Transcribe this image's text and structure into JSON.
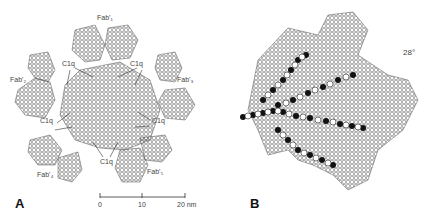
{
  "figure": {
    "panel_a": {
      "letter": "A",
      "labels": {
        "fab_top": "Fab'₁",
        "fab_left": "Fab'₂",
        "fab_right": "Fab'₃",
        "fab_bottom_left": "Fab'₄",
        "fab_bottom_right": "Fab'₅",
        "c1q_top_left": "C1q",
        "c1q_top_right": "C1q",
        "c1q_mid_left": "C1q",
        "c1q_mid_right": "C1q",
        "c1q_bottom": "C1q"
      },
      "scale_bar": {
        "ticks": [
          "0",
          "10",
          "20 nm"
        ]
      }
    },
    "panel_b": {
      "letter": "B",
      "angle_label": "28°"
    }
  }
}
